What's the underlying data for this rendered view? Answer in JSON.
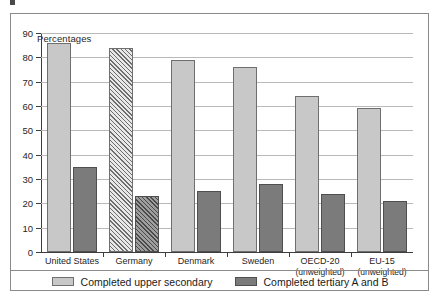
{
  "chart_data": {
    "type": "bar",
    "title": "",
    "axis_title": "Percentages",
    "xlabel": "",
    "ylabel": "",
    "ylim": [
      0,
      90
    ],
    "ytick_step": 10,
    "yticks": [
      "90",
      "80",
      "70",
      "60",
      "50",
      "40",
      "30",
      "20",
      "10",
      "0"
    ],
    "grid": true,
    "legend_position": "bottom",
    "categories": [
      {
        "label": "United States",
        "sub": ""
      },
      {
        "label": "Germany",
        "sub": ""
      },
      {
        "label": "Denmark",
        "sub": ""
      },
      {
        "label": "Sweden",
        "sub": ""
      },
      {
        "label": "OECD-20",
        "sub": "(unweighted)"
      },
      {
        "label": "EU-15",
        "sub": "(unweighted)"
      }
    ],
    "series": [
      {
        "name": "Completed upper secondary",
        "color": "#c8c8c8",
        "values": [
          86,
          84,
          79,
          76,
          64,
          59
        ]
      },
      {
        "name": "Completed tertiary A and B",
        "color": "#7b7b7b",
        "values": [
          35,
          23,
          25,
          28,
          24,
          21
        ]
      }
    ],
    "hatched_category_index": 1
  },
  "legend": {
    "items": [
      {
        "label": "Completed upper secondary",
        "swatch": "light"
      },
      {
        "label": "Completed tertiary A and B",
        "swatch": "dark"
      }
    ]
  },
  "colors": {
    "light_bar": "#c8c8c8",
    "dark_bar": "#7b7b7b",
    "bar_border": "#6f6f6f",
    "gridline": "#b9b9b9",
    "axis": "#3d3d3d",
    "frame": "#8a8a8a"
  }
}
